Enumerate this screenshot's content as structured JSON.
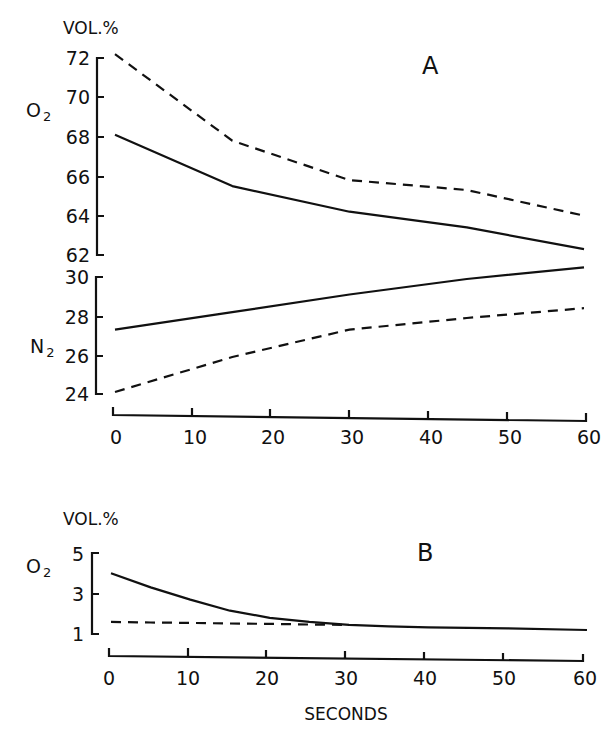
{
  "figure": {
    "panel_a": {
      "label": "A",
      "unit": "VOL.%",
      "o2_label": "O",
      "o2_sub": "2",
      "n2_label": "N",
      "n2_sub": "2",
      "o2_ticks": [
        "72",
        "70",
        "68",
        "66",
        "64",
        "62"
      ],
      "n2_ticks": [
        "30",
        "28",
        "26",
        "24"
      ],
      "x_ticks": [
        "0",
        "10",
        "20",
        "30",
        "40",
        "50",
        "60"
      ]
    },
    "panel_b": {
      "label": "B",
      "unit": "VOL.%",
      "o2_label": "O",
      "o2_sub": "2",
      "o2_ticks": [
        "5",
        "3",
        "1"
      ],
      "x_ticks": [
        "0",
        "10",
        "20",
        "30",
        "40",
        "50",
        "60"
      ],
      "x_title": "SECONDS"
    },
    "colors": {
      "ink": "#111111",
      "background": "#ffffff"
    }
  },
  "chart_data": [
    {
      "type": "line",
      "title": "A",
      "xlabel": "",
      "ylabel": "VOL.%",
      "x": [
        0,
        15,
        30,
        45,
        60
      ],
      "subplots": [
        {
          "name": "O2",
          "ylim": [
            62,
            72
          ],
          "yticks": [
            62,
            64,
            66,
            68,
            70,
            72
          ],
          "series": [
            {
              "name": "O2 solid",
              "style": "solid",
              "values": [
                68.1,
                65.5,
                64.2,
                63.4,
                62.3
              ]
            },
            {
              "name": "O2 dashed",
              "style": "dashed",
              "values": [
                72.2,
                67.8,
                65.8,
                65.3,
                64.0
              ]
            }
          ]
        },
        {
          "name": "N2",
          "ylim": [
            24,
            30
          ],
          "yticks": [
            24,
            26,
            28,
            30
          ],
          "series": [
            {
              "name": "N2 solid",
              "style": "solid",
              "values": [
                27.3,
                28.2,
                29.1,
                29.9,
                30.5
              ]
            },
            {
              "name": "N2 dashed",
              "style": "dashed",
              "values": [
                24.1,
                25.9,
                27.3,
                27.9,
                28.4
              ]
            }
          ]
        }
      ],
      "xlim": [
        0,
        60
      ],
      "xticks": [
        0,
        10,
        20,
        30,
        40,
        50,
        60
      ],
      "grid": false,
      "legend": "none"
    },
    {
      "type": "line",
      "title": "B",
      "xlabel": "SECONDS",
      "ylabel": "VOL.%",
      "x": [
        0,
        5,
        10,
        15,
        20,
        25,
        30,
        35,
        40,
        50,
        60
      ],
      "subplots": [
        {
          "name": "O2",
          "ylim": [
            1,
            5
          ],
          "yticks": [
            1,
            3,
            5
          ],
          "series": [
            {
              "name": "O2 solid",
              "style": "solid",
              "values": [
                4.0,
                3.3,
                2.7,
                2.15,
                1.8,
                1.6,
                1.45,
                1.38,
                1.33,
                1.28,
                1.2
              ]
            },
            {
              "name": "O2 dashed",
              "style": "dashed",
              "values": [
                1.6,
                1.57,
                1.55,
                1.52,
                1.5,
                1.47,
                1.45,
                null,
                null,
                null,
                null
              ]
            }
          ]
        }
      ],
      "xlim": [
        0,
        60
      ],
      "xticks": [
        0,
        10,
        20,
        30,
        40,
        50,
        60
      ],
      "grid": false,
      "legend": "none"
    }
  ]
}
